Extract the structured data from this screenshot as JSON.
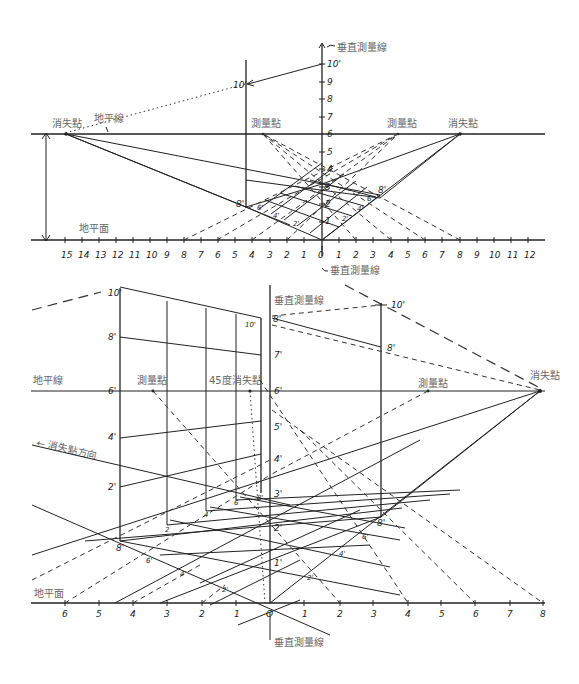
{
  "figure_top": {
    "labels": {
      "vanishing_point_left": "消失點",
      "vanishing_point_right": "消失點",
      "horizon_line": "地平線",
      "measuring_point_left": "測量點",
      "measuring_point_right": "測量點",
      "vertical_measure_line_top": "垂直測量線",
      "vertical_measure_line_bottom": "垂直測量線",
      "ground_plane": "地平面",
      "ten_ft_marker": "10'",
      "height_scale_top": "10'",
      "eight_left": "8'",
      "eight_right": "8'",
      "grid_labels_left": [
        "6'",
        "4'",
        "2'"
      ],
      "grid_labels_right": [
        "2'",
        "4'",
        "6'"
      ]
    },
    "vertical_scale": [
      "1",
      "2",
      "3",
      "4",
      "5",
      "6",
      "7",
      "8",
      "9"
    ],
    "ground_scale_left": [
      "15",
      "14",
      "13",
      "12",
      "11",
      "10",
      "9",
      "8",
      "7",
      "6",
      "5",
      "4",
      "3",
      "2",
      "1"
    ],
    "ground_scale_origin": "0",
    "ground_scale_right": [
      "1",
      "2",
      "3",
      "4",
      "5",
      "6",
      "7",
      "8",
      "9",
      "10",
      "11",
      "12"
    ]
  },
  "figure_bottom": {
    "labels": {
      "horizon_line": "地平線",
      "measuring_point_left": "測量點",
      "vp45": "45度消失點",
      "measuring_point_right": "測量點",
      "vanishing_point_right": "消失點",
      "vanishing_direction": "← 消失點方向",
      "vertical_measure_line_top": "垂直測量線",
      "vertical_measure_line_bottom": "垂直測量線",
      "ground_plane": "地平面",
      "left_post_heights": [
        "10'",
        "8'",
        "6'",
        "4'",
        "2'"
      ],
      "left_post_base": "8'",
      "center_scale": [
        "1'",
        "2'",
        "3'",
        "4'",
        "5'",
        "6'",
        "7'",
        "8'"
      ],
      "right_post_top": "10'",
      "right_post_mid": "8'",
      "right_post_base": "8'",
      "inner_post_top": "10'",
      "inner_post_base": "8'",
      "grid_labels_left": [
        "6'",
        "4'",
        "2'"
      ],
      "grid_labels_right": [
        "2'",
        "4'",
        "6'"
      ],
      "post_bottoms": [
        "2",
        "4",
        "6"
      ]
    },
    "ground_scale_left": [
      "6",
      "5",
      "4",
      "3",
      "2",
      "1"
    ],
    "ground_scale_origin": "O",
    "ground_scale_right": [
      "1",
      "2",
      "3",
      "4",
      "5",
      "6",
      "7",
      "8"
    ]
  }
}
